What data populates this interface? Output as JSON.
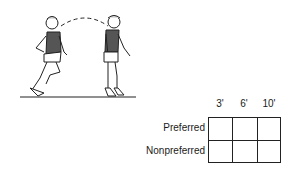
{
  "illustration": {
    "description": "Two figures of a child performing a hop/leap; dashed arc shows trajectory from left figure to right figure over a ground line",
    "figures": [
      "left-runner-figure",
      "right-landing-figure"
    ]
  },
  "grid": {
    "columns": [
      "3'",
      "6'",
      "10'"
    ],
    "rows": [
      "Preferred",
      "Nonpreferred"
    ],
    "cells": [
      [
        "",
        "",
        ""
      ],
      [
        "",
        "",
        ""
      ]
    ]
  }
}
